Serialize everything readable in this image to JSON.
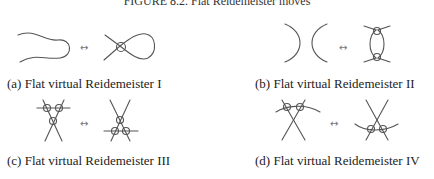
{
  "figure": {
    "title": "FIGURE 8.2. Flat Reidemeister moves",
    "arrow_symbol": "↔",
    "panels": [
      {
        "id": "a",
        "caption": "(a) Flat virtual Reidemeister I"
      },
      {
        "id": "b",
        "caption": "(b) Flat virtual Reidemeister II"
      },
      {
        "id": "c",
        "caption": "(c) Flat virtual Reidemeister III"
      },
      {
        "id": "d",
        "caption": "(d) Flat virtual Reidemeister IV"
      }
    ]
  }
}
